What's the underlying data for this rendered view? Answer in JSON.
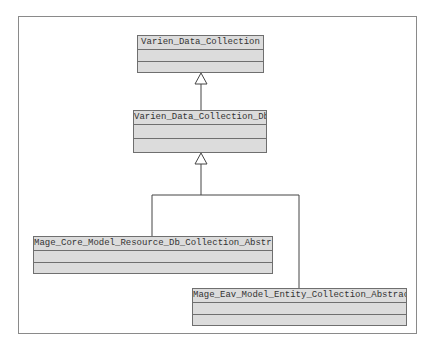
{
  "diagram": {
    "type": "uml-class-hierarchy",
    "classes": [
      {
        "id": "c1",
        "name": "Varien_Data_Collection"
      },
      {
        "id": "c2",
        "name": "Varien_Data_Collection_Db"
      },
      {
        "id": "c3",
        "name": "Mage_Core_Model_Resource_Db_Collection_Abstract"
      },
      {
        "id": "c4",
        "name": "Mage_Eav_Model_Entity_Collection_Abstract"
      }
    ],
    "relations": [
      {
        "from": "Varien_Data_Collection_Db",
        "to": "Varien_Data_Collection",
        "type": "generalization"
      },
      {
        "from": "Mage_Core_Model_Resource_Db_Collection_Abstract",
        "to": "Varien_Data_Collection_Db",
        "type": "generalization"
      },
      {
        "from": "Mage_Eav_Model_Entity_Collection_Abstract",
        "to": "Varien_Data_Collection_Db",
        "type": "generalization"
      }
    ],
    "colors": {
      "box_fill": "#dcdcdc",
      "box_border": "#6f6f6f",
      "line": "#444444",
      "frame": "#8a8a8a"
    }
  }
}
